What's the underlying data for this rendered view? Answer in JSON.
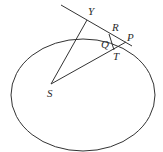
{
  "diagram": {
    "labels": {
      "Y": "Y",
      "R": "R",
      "P": "P",
      "Q": "Q",
      "T": "T",
      "S": "S"
    },
    "colors": {
      "stroke": "#333333",
      "text": "#2a2a2a",
      "background": "#ffffff"
    }
  }
}
